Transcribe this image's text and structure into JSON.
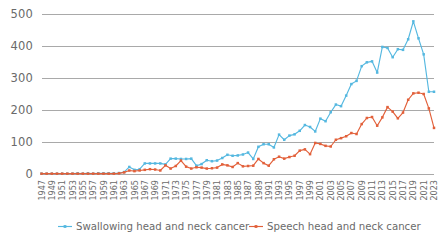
{
  "chart_data": {
    "type": "line",
    "title": "",
    "subtitle": "",
    "xlabel": "",
    "ylabel": "",
    "ylim": [
      0,
      500
    ],
    "yticks": [
      0,
      100,
      200,
      300,
      400,
      500
    ],
    "grid": true,
    "legend_position": "bottom",
    "x_tick_step": 2,
    "x": [
      1947,
      1948,
      1949,
      1950,
      1951,
      1952,
      1953,
      1954,
      1955,
      1956,
      1957,
      1958,
      1959,
      1960,
      1961,
      1962,
      1963,
      1964,
      1965,
      1966,
      1967,
      1968,
      1969,
      1970,
      1971,
      1972,
      1973,
      1974,
      1975,
      1976,
      1977,
      1978,
      1979,
      1980,
      1981,
      1982,
      1983,
      1984,
      1985,
      1986,
      1987,
      1988,
      1989,
      1990,
      1991,
      1992,
      1993,
      1994,
      1995,
      1996,
      1997,
      1998,
      1999,
      2000,
      2001,
      2002,
      2003,
      2004,
      2005,
      2006,
      2007,
      2008,
      2009,
      2010,
      2011,
      2012,
      2013,
      2014,
      2015,
      2016,
      2017,
      2018,
      2019,
      2020,
      2021,
      2022,
      2023
    ],
    "xticks": [
      1947,
      1949,
      1951,
      1953,
      1955,
      1957,
      1959,
      1961,
      1963,
      1965,
      1967,
      1969,
      1971,
      1973,
      1975,
      1977,
      1979,
      1981,
      1983,
      1985,
      1987,
      1989,
      1991,
      1993,
      1995,
      1997,
      1999,
      2001,
      2003,
      2005,
      2007,
      2009,
      2011,
      2013,
      2015,
      2017,
      2019,
      2021,
      2023
    ],
    "series": [
      {
        "name": "Swallowing head and neck cancer",
        "color": "#55B8E0",
        "marker": "square",
        "values": [
          1,
          1,
          1,
          1,
          1,
          1,
          1,
          2,
          1,
          2,
          1,
          2,
          2,
          2,
          2,
          3,
          6,
          22,
          13,
          15,
          33,
          33,
          33,
          33,
          30,
          48,
          48,
          47,
          47,
          48,
          26,
          31,
          43,
          40,
          42,
          50,
          60,
          57,
          58,
          61,
          67,
          47,
          85,
          93,
          93,
          83,
          123,
          107,
          120,
          124,
          135,
          153,
          147,
          133,
          173,
          165,
          193,
          217,
          212,
          245,
          281,
          291,
          337,
          349,
          352,
          317,
          397,
          394,
          365,
          390,
          388,
          421,
          477,
          424,
          374,
          257,
          257
        ]
      },
      {
        "name": "Speech head and neck cancer",
        "color": "#E2603A",
        "marker": "square",
        "values": [
          1,
          1,
          1,
          1,
          1,
          1,
          1,
          1,
          1,
          1,
          1,
          1,
          1,
          1,
          1,
          2,
          5,
          11,
          9,
          11,
          13,
          15,
          14,
          11,
          27,
          17,
          25,
          42,
          23,
          17,
          21,
          20,
          17,
          18,
          20,
          30,
          27,
          22,
          34,
          24,
          25,
          26,
          47,
          34,
          26,
          46,
          54,
          48,
          53,
          57,
          73,
          77,
          62,
          97,
          94,
          88,
          86,
          107,
          112,
          118,
          128,
          125,
          156,
          175,
          178,
          151,
          177,
          209,
          195,
          174,
          192,
          232,
          252,
          254,
          250,
          205,
          144
        ]
      }
    ]
  },
  "legend": {
    "items": [
      {
        "label": "Swallowing head and neck cancer",
        "color": "#55B8E0"
      },
      {
        "label": "Speech head and neck cancer",
        "color": "#E2603A"
      }
    ]
  },
  "axis": {
    "y_labels": [
      "500",
      "400",
      "300",
      "200",
      "100",
      "0"
    ],
    "gridline_color": "#a9a9a9",
    "label_color": "#6a6a6a"
  }
}
